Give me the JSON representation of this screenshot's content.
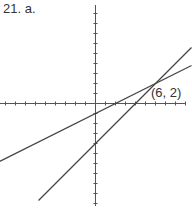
{
  "problem_label": "21. a.",
  "chart_data": {
    "type": "line",
    "title": "21. a.",
    "xlabel": "",
    "ylabel": "",
    "xlim": [
      -10,
      9.5
    ],
    "ylim": [
      -10,
      10
    ],
    "grid": false,
    "tick_spacing": 1,
    "series": [
      {
        "name": "line-1",
        "equation": "y = 0.5x - 1",
        "slope": 0.5,
        "intercept": -1,
        "x": [
          -9.6,
          9.6
        ],
        "y": [
          -5.8,
          3.8
        ]
      },
      {
        "name": "line-2",
        "equation": "y = x - 4",
        "slope": 1,
        "intercept": -4,
        "x": [
          -5.7,
          9.6
        ],
        "y": [
          -9.7,
          5.6
        ]
      }
    ],
    "annotations": [
      {
        "text": "(6, 2)",
        "x": 6,
        "y": 2
      }
    ]
  },
  "colors": {
    "axis": "#555555",
    "line": "#444444",
    "text": "#333333"
  }
}
